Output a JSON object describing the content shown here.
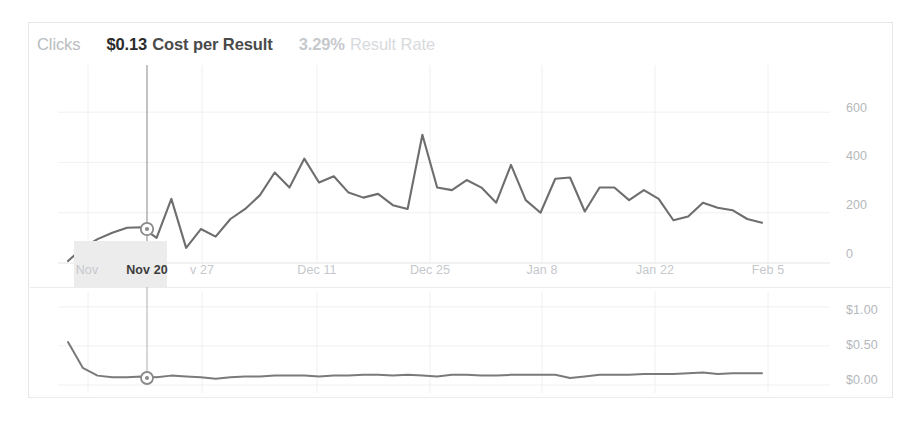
{
  "header": {
    "metrics": [
      {
        "name": "clicks",
        "value": "",
        "label": "Clicks",
        "style": "m-clicks"
      },
      {
        "name": "cost-per-result",
        "value": "$0.13",
        "label": "Cost per Result",
        "style": "m-cost"
      },
      {
        "name": "result-rate",
        "value": "3.29%",
        "label": "Result Rate",
        "style": "m-rate"
      }
    ]
  },
  "colors": {
    "line": "#6e6e6e",
    "grid": "#f0f0f0",
    "crosshair": "#9a9a9a",
    "axis_text": "#b5b8bc",
    "active_text": "#3d3d3d",
    "highlight_bg": "#ececec",
    "card_border": "#e6e6e6"
  },
  "hover": {
    "date": "Nov 20",
    "x_px": 117,
    "top_marker_y_px": 164,
    "bottom_marker_y_px": 91
  },
  "chart_data": [
    {
      "type": "line",
      "name": "clicks-chart",
      "title": "Clicks",
      "xlabel": "",
      "ylabel": "Clicks",
      "ylim": [
        0,
        700
      ],
      "yticks": [
        600,
        400,
        200,
        0
      ],
      "ytick_labels": [
        "600",
        "400",
        "200",
        "0"
      ],
      "grid": true,
      "legend": "none",
      "xticks": [
        "Nov 13",
        "Nov 20",
        "Nov 27",
        "Dec 11",
        "Dec 25",
        "Jan 8",
        "Jan 22",
        "Feb 5"
      ],
      "xtick_px": [
        58,
        117,
        172,
        287,
        400,
        512,
        625,
        738
      ],
      "x": [
        "Nov 12",
        "Nov 14",
        "Nov 16",
        "Nov 18",
        "Nov 20",
        "Nov 22",
        "Nov 24",
        "Nov 26",
        "Nov 28",
        "Nov 30",
        "Dec 2",
        "Dec 4",
        "Dec 6",
        "Dec 8",
        "Dec 10",
        "Dec 12",
        "Dec 14",
        "Dec 16",
        "Dec 18",
        "Dec 20",
        "Dec 22",
        "Dec 24",
        "Dec 26",
        "Dec 28",
        "Dec 30",
        "Jan 1",
        "Jan 3",
        "Jan 5",
        "Jan 7",
        "Jan 9",
        "Jan 11",
        "Jan 13",
        "Jan 15",
        "Jan 17",
        "Jan 19",
        "Jan 21",
        "Jan 23",
        "Jan 25",
        "Jan 27",
        "Jan 29",
        "Jan 31",
        "Feb 2"
      ],
      "values": [
        8,
        60,
        95,
        120,
        140,
        142,
        100,
        255,
        60,
        135,
        105,
        175,
        215,
        270,
        360,
        300,
        415,
        320,
        345,
        280,
        260,
        275,
        230,
        215,
        510,
        300,
        290,
        330,
        300,
        240,
        390,
        250,
        200,
        335,
        340,
        205,
        300,
        300,
        250,
        290,
        255,
        170,
        185,
        240,
        220,
        210,
        175,
        160
      ]
    },
    {
      "type": "line",
      "name": "cost-per-result-chart",
      "title": "Cost per Result",
      "xlabel": "",
      "ylabel": "Cost per Result",
      "ylim": [
        0,
        1.1
      ],
      "yticks": [
        1.0,
        0.5,
        0.0
      ],
      "ytick_labels": [
        "$1.00",
        "$0.50",
        "$0.00"
      ],
      "grid": true,
      "legend": "none",
      "values": [
        0.55,
        0.22,
        0.12,
        0.1,
        0.1,
        0.11,
        0.1,
        0.12,
        0.11,
        0.1,
        0.08,
        0.1,
        0.11,
        0.11,
        0.12,
        0.12,
        0.12,
        0.11,
        0.12,
        0.12,
        0.13,
        0.13,
        0.12,
        0.13,
        0.12,
        0.11,
        0.13,
        0.13,
        0.12,
        0.12,
        0.13,
        0.13,
        0.13,
        0.13,
        0.09,
        0.11,
        0.13,
        0.13,
        0.13,
        0.14,
        0.14,
        0.14,
        0.15,
        0.16,
        0.14,
        0.15,
        0.15,
        0.15
      ]
    }
  ]
}
